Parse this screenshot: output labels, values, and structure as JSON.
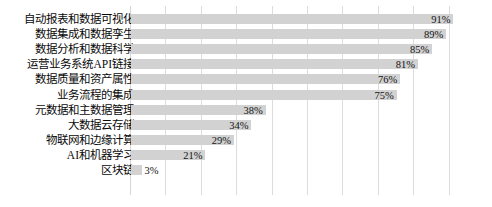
{
  "chart_data": {
    "type": "bar",
    "orientation": "horizontal",
    "title": "",
    "subtitle": "",
    "xlabel": "",
    "ylabel": "",
    "xlim": [
      0,
      100
    ],
    "grid": true,
    "gridline_values": [
      10,
      20,
      30,
      40,
      50,
      60,
      70,
      80,
      90
    ],
    "legend": null,
    "value_suffix": "%",
    "categories": [
      "自动报表和数据可视化",
      "数据集成和数据孪生",
      "数据分析和数据科学",
      "运营业务系统API链接",
      "数据质量和资产属性",
      "业务流程的集成",
      "元数据和主数据管理",
      "大数据云存储",
      "物联网和边缘计算",
      "AI和机器学习",
      "区块链"
    ],
    "values": [
      91,
      89,
      85,
      81,
      76,
      75,
      38,
      34,
      29,
      21,
      3
    ],
    "value_labels": [
      "91%",
      "89%",
      "85%",
      "81%",
      "76%",
      "75%",
      "38%",
      "34%",
      "29%",
      "21%",
      "3%"
    ],
    "colors": {
      "bar": "#d2d2d2",
      "gridline": "#dcdcdc",
      "background": "#ffffff",
      "text": "#0a0a0a"
    }
  }
}
